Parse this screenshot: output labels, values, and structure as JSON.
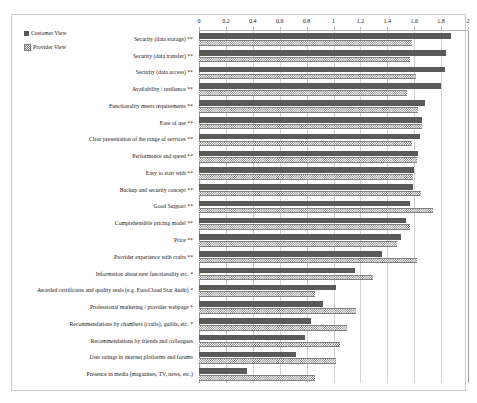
{
  "chart_data": {
    "type": "bar",
    "orientation": "horizontal",
    "title": "",
    "subtitle": "",
    "xlabel": "",
    "ylabel": "",
    "xlim": [
      0,
      2
    ],
    "xticks": [
      0,
      0.2,
      0.4,
      0.6,
      0.8,
      1,
      1.2,
      1.4,
      1.6,
      1.8,
      2
    ],
    "xtick_labels": [
      "0",
      "0.2",
      "0.4",
      "0.6",
      "0.8",
      "1",
      "1.2",
      "1.4",
      "1.6",
      "1.8",
      "2"
    ],
    "grid": true,
    "grid_axis": "x",
    "legend_position": "top-left",
    "categories": [
      "Security (data storage) **",
      "Security (data transfer) **",
      "Security (data access) **",
      "Availability / resilience **",
      "Functionality meets requirements **",
      "Ease of use **",
      "Clear presentation of the range of services **",
      "Performance and speed **",
      "Easy to start with **",
      "Backup and security concept **",
      "Good Support **",
      "Comprehensible pricing model **",
      "Price **",
      "Provider experience with crafts **",
      "Information about new functionality etc. *",
      "Awarded certificates and quality seals (e.g. EuroCloud Star Audit) *",
      "Professional marketing / provider webpage *",
      "Recommendations by chambers (crafts), guilds, etc. *",
      "Recommendations by friends and colleagues",
      "User ratings in internet platforms and forums",
      "Presence in media (magazines, TV, news, etc.)"
    ],
    "series": [
      {
        "name": "Customer View",
        "color": "#5a5a5a",
        "pattern": "solid",
        "values": [
          1.87,
          1.84,
          1.83,
          1.8,
          1.68,
          1.66,
          1.64,
          1.63,
          1.6,
          1.59,
          1.57,
          1.54,
          1.5,
          1.36,
          1.16,
          1.02,
          0.92,
          0.83,
          0.79,
          0.72,
          0.36
        ]
      },
      {
        "name": "Provider View",
        "color": "#777777",
        "pattern": "checkered",
        "values": [
          1.58,
          1.57,
          1.61,
          1.55,
          1.63,
          1.66,
          1.58,
          1.62,
          1.59,
          1.65,
          1.74,
          1.57,
          1.47,
          1.62,
          1.29,
          0.86,
          1.17,
          1.1,
          1.05,
          1.02,
          0.86
        ]
      }
    ]
  },
  "legend": {
    "items": [
      {
        "label": "Customer View",
        "marker": "solid-square-dark"
      },
      {
        "label": "Provider View",
        "marker": "checkered-square-light"
      }
    ]
  }
}
